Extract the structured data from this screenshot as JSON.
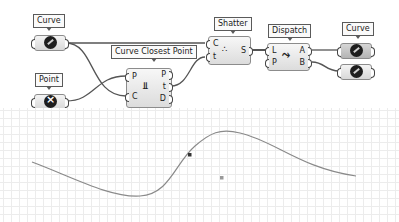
{
  "canvas": {
    "params": [
      {
        "id": "curve_in",
        "tag": "Curve",
        "icon": "curve-icon"
      },
      {
        "id": "point_in",
        "tag": "Point",
        "icon": "point-icon"
      },
      {
        "id": "curve_out",
        "tag": "Curve",
        "icon": "curve-icon"
      }
    ],
    "components": {
      "ccp": {
        "tag": "Curve Closest Point",
        "inputs": [
          "P",
          "C"
        ],
        "outputs": [
          "P",
          "t",
          "D"
        ],
        "icon": "closest-point-icon"
      },
      "shatter": {
        "tag": "Shatter",
        "inputs": [
          "C",
          "t"
        ],
        "outputs": [
          "S"
        ],
        "icon": "shatter-icon"
      },
      "dispatch": {
        "tag": "Dispatch",
        "inputs": [
          "L",
          "P"
        ],
        "outputs": [
          "A",
          "B"
        ],
        "icon": "dispatch-icon"
      }
    }
  },
  "viewport": {
    "grid": true,
    "curve_color": "#8a8a8a",
    "closest_point_marker": "closest-point-marker",
    "input_point_marker": "input-point-marker"
  }
}
